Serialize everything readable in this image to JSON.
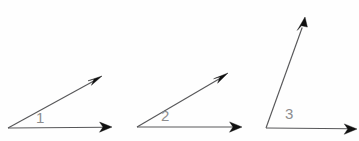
{
  "figure": {
    "name": "three-angles-diagram",
    "background_color": "#fefefe",
    "width": 359,
    "height": 141,
    "line_color": "#58585a",
    "arrow_color": "#101010",
    "label_color": "#8d8d8f"
  },
  "angles": [
    {
      "label": "1",
      "vertex": {
        "x": 8,
        "y": 128
      },
      "horizontal_ray_tip": {
        "x": 112,
        "y": 127
      },
      "diagonal_ray_tip": {
        "x": 102,
        "y": 76
      },
      "measure_degrees": 26,
      "label_position": {
        "x": 36,
        "y": 110
      }
    },
    {
      "label": "2",
      "vertex": {
        "x": 137,
        "y": 127
      },
      "horizontal_ray_tip": {
        "x": 242,
        "y": 127
      },
      "diagonal_ray_tip": {
        "x": 228,
        "y": 73
      },
      "measure_degrees": 28,
      "label_position": {
        "x": 161,
        "y": 108
      }
    },
    {
      "label": "3",
      "vertex": {
        "x": 266,
        "y": 128
      },
      "horizontal_ray_tip": {
        "x": 357,
        "y": 129
      },
      "diagonal_ray_tip": {
        "x": 305,
        "y": 17
      },
      "measure_degrees": 70,
      "label_position": {
        "x": 285,
        "y": 106
      }
    }
  ]
}
